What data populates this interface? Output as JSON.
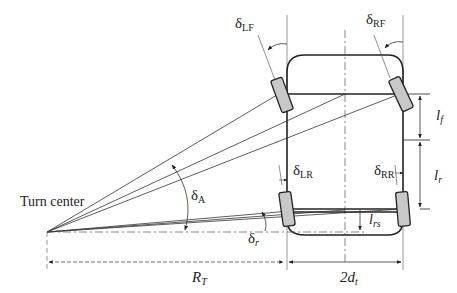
{
  "diagram": {
    "labels": {
      "turn_center": "Turn center",
      "delta_LF": "δ",
      "delta_LF_sub": "LF",
      "delta_RF": "δ",
      "delta_RF_sub": "RF",
      "delta_LR": "δ",
      "delta_LR_sub": "LR",
      "delta_RR": "δ",
      "delta_RR_sub": "RR",
      "delta_A": "δ",
      "delta_A_sub": "A",
      "delta_r": "δ",
      "delta_r_sub": "r",
      "l_f": "l",
      "l_f_sub": "f",
      "l_r": "l",
      "l_r_sub": "r",
      "l_rs": "l",
      "l_rs_sub": "rs",
      "R_T": "R",
      "R_T_sub": "T",
      "two_d_t": "2d",
      "two_d_t_sub": "t"
    },
    "colors": {
      "line": "#222222",
      "wheel_fill": "#c8c8c8",
      "background": "#ffffff"
    }
  }
}
